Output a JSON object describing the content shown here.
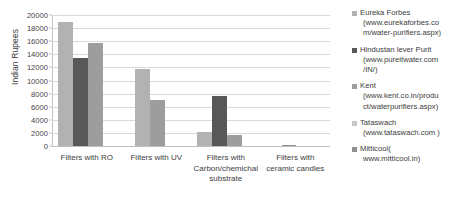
{
  "chart_data": {
    "type": "bar",
    "title": "",
    "xlabel": "",
    "ylabel": "Indian Rupees",
    "ylim": [
      0,
      20000
    ],
    "ytick_step": 2000,
    "yticks": [
      "0",
      "2000",
      "4000",
      "6000",
      "8000",
      "10000",
      "12000",
      "14000",
      "16000",
      "18000",
      "20000"
    ],
    "grid": true,
    "legend_position": "right",
    "categories": [
      "Filters with RO",
      "Filters with UV",
      "Filters with Carbon/chemichal substrate",
      "Filters with ceramic candles"
    ],
    "series": [
      {
        "name": "Eureka Forbes",
        "url": "(www.eurekaforbes.com/water-purifiers.aspx)",
        "color": "#b2b2b2",
        "values": [
          18900,
          11800,
          2100,
          0
        ]
      },
      {
        "name": "Hindustan lever Purit",
        "url": "(www.pureitwater.com/IN/)",
        "color": "#585858",
        "values": [
          13400,
          0,
          7700,
          0
        ]
      },
      {
        "name": "Kent",
        "url": "(www.kent.co.in/product/waterpurifiers.aspx)",
        "color": "#9d9d9d",
        "values": [
          15800,
          7050,
          1650,
          0
        ]
      },
      {
        "name": "Tataswach",
        "url": "(www.tataswach.com )",
        "color": "#c7c7c7",
        "values": [
          0,
          0,
          0,
          0
        ]
      },
      {
        "name": "Mitticool(",
        "url": "www.mitticool.in)",
        "color": "#8f8f8f",
        "values": [
          0,
          0,
          0,
          180
        ]
      }
    ]
  },
  "legend": {
    "items": [
      {
        "name": "Eureka Forbes",
        "url_line1": "(www.eurekaforbes.co",
        "url_line2": "m/water-purifiers.aspx)",
        "color": "#b2b2b2"
      },
      {
        "name": "Hindustan lever Purit",
        "url_line1": "(www.pureitwater.com",
        "url_line2": "/IN/)",
        "color": "#585858"
      },
      {
        "name": "Kent",
        "url_line1": "(www.kent.co.in/produ",
        "url_line2": "ct/waterpurifiers.aspx)",
        "color": "#9d9d9d"
      },
      {
        "name": "Tataswach",
        "url_line1": "(www.tataswach.com )",
        "url_line2": "",
        "color": "#c7c7c7"
      },
      {
        "name": "Mitticool(",
        "url_line1": "www.mitticool.in)",
        "url_line2": "",
        "color": "#8f8f8f"
      }
    ]
  }
}
